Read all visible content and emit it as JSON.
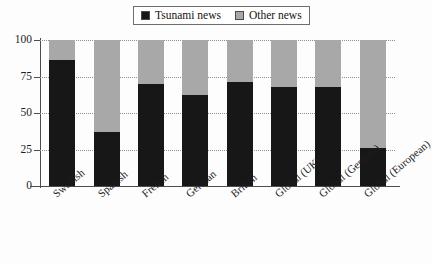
{
  "chart_data": {
    "type": "bar",
    "subtype": "stacked-percentage",
    "title": "",
    "xlabel": "",
    "ylabel": "",
    "ylim": [
      0,
      100
    ],
    "yticks": [
      0,
      25,
      50,
      75,
      100
    ],
    "grid": true,
    "legend_position": "top-center",
    "categories": [
      "Swedish",
      "Spanish",
      "French",
      "German",
      "British",
      "Global (UK)",
      "Global (German)",
      "Global (European)"
    ],
    "series": [
      {
        "name": "Tsunami news",
        "color": "#171717",
        "values": [
          86,
          37,
          70,
          62,
          71,
          68,
          68,
          26
        ]
      },
      {
        "name": "Other news",
        "color": "#a8a8a8",
        "values": [
          14,
          63,
          30,
          38,
          29,
          32,
          32,
          74
        ]
      }
    ]
  },
  "legend": {
    "entries": [
      {
        "label": "Tsunami news",
        "color": "#171717"
      },
      {
        "label": "Other news",
        "color": "#a8a8a8"
      }
    ]
  },
  "axis": {
    "y_tick_labels": [
      "100",
      "75",
      "50",
      "25",
      "0"
    ]
  }
}
